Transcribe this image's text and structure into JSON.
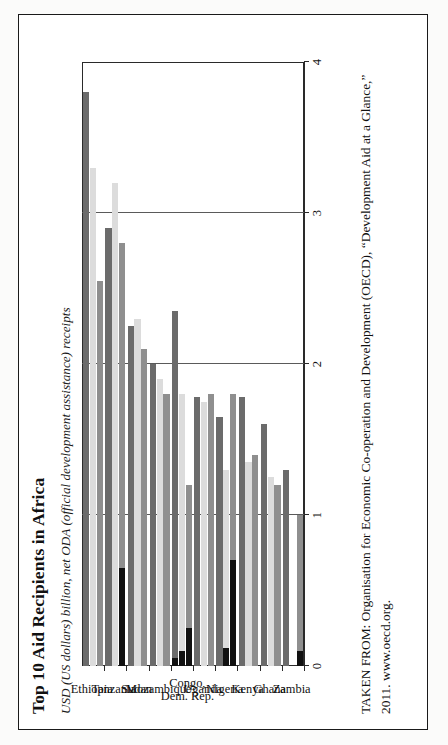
{
  "figure": {
    "title": "Top 10 Aid Recipients in Africa",
    "subtitle": "USD (US dollars) billion, net ODA (official development assistance) receipts",
    "source_line_1": "TAKEN FROM: Organisation for Economic Co-operation and Development (OECD), “Development Aid at a Glance,”",
    "source_line_2": "2011. www.oecd.org."
  },
  "colors": {
    "series_2007": "#8f8f8f",
    "series_2008": "#dcdcdc",
    "series_2009": "#6b6b6b",
    "debt_relief": "#111111",
    "frame": "#2a2a2a",
    "page_background": "#ffffff"
  },
  "legend": {
    "items": [
      {
        "label": "2007",
        "color": "#8f8f8f"
      },
      {
        "label": "2008",
        "color": "#dcdcdc"
      },
      {
        "label": "2009",
        "color": "#6b6b6b"
      },
      {
        "label": "Net debt relief grants",
        "color": "#111111"
      }
    ]
  },
  "axis": {
    "ticks": [
      "0",
      "1",
      "2",
      "3",
      "4"
    ],
    "min": 0,
    "max": 4,
    "label": ""
  },
  "chart_data": {
    "type": "bar",
    "orientation": "vertical",
    "title": "Top 10 Aid Recipients in Africa",
    "subtitle": "USD (US dollars) billion, net ODA (official development assistance) receipts",
    "xlabel": "",
    "ylabel": "USD (US dollars) billion",
    "ylim": [
      0,
      4
    ],
    "yticks": [
      0,
      1,
      2,
      3,
      4
    ],
    "grid": true,
    "legend_position": "top",
    "categories": [
      "Ethiopia",
      "Tanzania",
      "Sudan",
      "Mozambique",
      "Congo, Dem. Rep.",
      "Uganda",
      "Nigeria",
      "Kenya",
      "Ghana",
      "Zambia"
    ],
    "category_lines": [
      [
        "Ethiopia"
      ],
      [
        "Tanzania"
      ],
      [
        "Sudan"
      ],
      [
        "Mozambique"
      ],
      [
        "Congo,",
        "Dem. Rep."
      ],
      [
        "Uganda"
      ],
      [
        "Nigeria"
      ],
      [
        "Kenya"
      ],
      [
        "Ghana"
      ],
      [
        "Zambia"
      ]
    ],
    "series": [
      {
        "name": "2007",
        "color": "#8f8f8f",
        "values": [
          2.55,
          2.8,
          2.1,
          1.8,
          1.2,
          1.8,
          1.8,
          1.4,
          1.2,
          1.0
        ]
      },
      {
        "name": "2008",
        "color": "#dcdcdc",
        "values": [
          3.3,
          3.2,
          2.3,
          1.9,
          1.8,
          1.75,
          1.3,
          1.35,
          1.25,
          0.0
        ]
      },
      {
        "name": "2009",
        "color": "#6b6b6b",
        "values": [
          3.8,
          2.9,
          2.25,
          2.0,
          2.35,
          1.78,
          1.65,
          1.78,
          1.6,
          1.3
        ]
      }
    ],
    "debt_relief_grants": [
      {
        "series": "2007",
        "color": "#111111",
        "values": [
          0.0,
          0.65,
          0.0,
          0.0,
          0.25,
          0.0,
          0.7,
          0.0,
          0.0,
          0.1
        ]
      },
      {
        "series": "2008",
        "color": "#111111",
        "values": [
          0.0,
          0.0,
          0.0,
          0.0,
          0.1,
          0.0,
          0.12,
          0.0,
          0.0,
          0.0
        ]
      },
      {
        "series": "2009",
        "color": "#111111",
        "values": [
          0.0,
          0.0,
          0.0,
          0.0,
          0.05,
          0.0,
          0.0,
          0.0,
          0.0,
          0.0
        ]
      }
    ]
  }
}
